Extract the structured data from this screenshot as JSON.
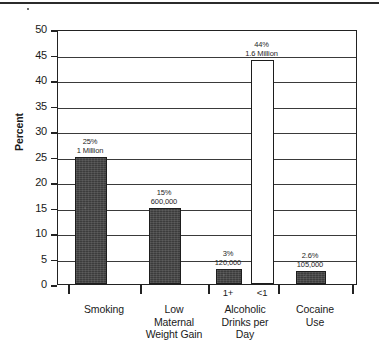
{
  "chart_data": {
    "type": "bar",
    "title": "",
    "xlabel": "",
    "ylabel": "Percent",
    "ylim": [
      0,
      50
    ],
    "ytick_step": 5,
    "grid": true,
    "legend": "none",
    "yticks": [
      "50",
      "45",
      "40",
      "35",
      "30",
      "25",
      "20",
      "15",
      "10",
      "5",
      "0"
    ],
    "categories": [
      "Smoking",
      "Low Maternal Weight Gain",
      "Alcoholic Drinks per Day",
      "Cocaine Use"
    ],
    "bars": [
      {
        "group": "Smoking",
        "sublabel": "",
        "value": 25,
        "percent_label": "25%",
        "count_label": "1 Million",
        "style": "filled"
      },
      {
        "group": "Low Maternal Weight Gain",
        "sublabel": "",
        "value": 15,
        "percent_label": "15%",
        "count_label": "600,000",
        "style": "filled"
      },
      {
        "group": "Alcoholic Drinks per Day",
        "sublabel": "1+",
        "value": 3,
        "percent_label": "3%",
        "count_label": "120,000",
        "style": "filled"
      },
      {
        "group": "Alcoholic Drinks per Day",
        "sublabel": "<1",
        "value": 44,
        "percent_label": "44%",
        "count_label": "1.6 Million",
        "style": "hollow"
      },
      {
        "group": "Cocaine Use",
        "sublabel": "",
        "value": 2.6,
        "percent_label": "2.6%",
        "count_label": "105,000",
        "style": "filled"
      }
    ],
    "colors": {
      "bar_fill": "#3c3c3c",
      "bar_outline": "#1d1d1d",
      "hollow_fill": "#ffffff",
      "axis": "#222222",
      "grid": "#3a3a3a",
      "text": "#1a1a1a",
      "background": "#ffffff"
    }
  },
  "axis": {
    "y_title": "Percent"
  },
  "category_labels": [
    {
      "lines": [
        "Smoking"
      ]
    },
    {
      "lines": [
        "Low",
        "Maternal",
        "Weight Gain"
      ]
    },
    {
      "lines": [
        "Alcoholic",
        "Drinks per",
        "Day"
      ]
    },
    {
      "lines": [
        "Cocaine",
        "Use"
      ]
    }
  ],
  "sublabels": [
    "1+",
    "<1"
  ]
}
